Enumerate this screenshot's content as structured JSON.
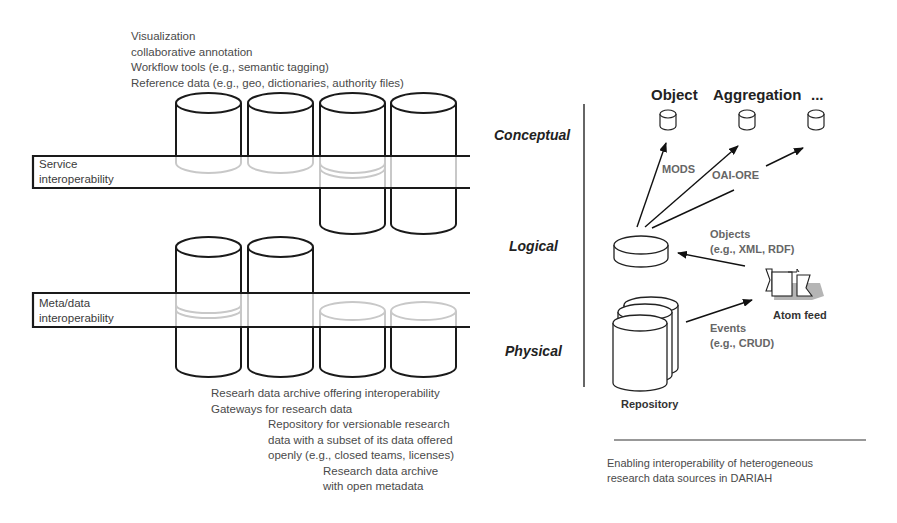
{
  "left_panel": {
    "top_labels": [
      "Visualization",
      "collaborative annotation",
      "Workflow tools (e.g., semantic tagging)",
      "Reference data (e.g., geo, dictionaries, authority files)"
    ],
    "bands": [
      {
        "line1": "Service",
        "line2": "interoperability"
      },
      {
        "line1": "Meta/data",
        "line2": "interoperability"
      }
    ],
    "bottom_labels": [
      {
        "indent": 0,
        "text": "Researh data archive offering interoperability"
      },
      {
        "indent": 0,
        "text": "Gateways for research data"
      },
      {
        "indent": 1,
        "text": "Repository for versionable research"
      },
      {
        "indent": 1,
        "text": "data with a subset of its data offered"
      },
      {
        "indent": 1,
        "text": "openly (e.g., closed teams, licenses)"
      },
      {
        "indent": 2,
        "text": "Research data archive"
      },
      {
        "indent": 2,
        "text": "with open metadata"
      }
    ]
  },
  "right_panel": {
    "layers": [
      "Conceptual",
      "Logical",
      "Physical"
    ],
    "headers": [
      "Object",
      "Aggregation",
      "..."
    ],
    "arrow_labels": {
      "mods": "MODS",
      "oai_ore": "OAI-ORE",
      "objects_line1": "Objects",
      "objects_line2": "(e.g., XML, RDF)",
      "events_line1": "Events",
      "events_line2": "(e.g., CRUD)"
    },
    "atom_feed_label": "Atom feed",
    "repository_label": "Repository",
    "caption_line1": "Enabling interoperability of heterogeneous",
    "caption_line2": "research data sources in DARIAH"
  },
  "colors": {
    "stroke": "#1a1a1a",
    "ghost": "#c8c8c8",
    "feed_shadow": "#b5b5b5"
  }
}
